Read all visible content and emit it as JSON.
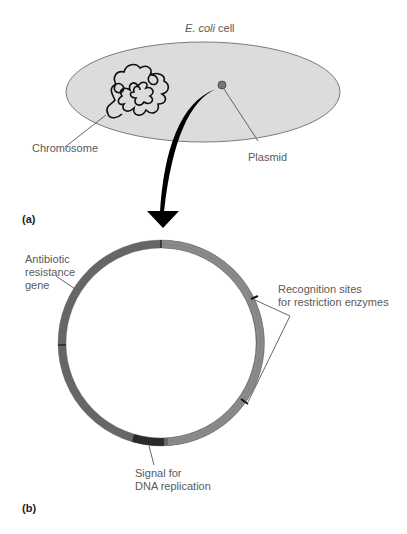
{
  "figure": {
    "panel_a": {
      "label": "(a)",
      "cell_title_italic": "E. coli",
      "cell_title_rest": " cell",
      "chromosome_label": "Chromosome",
      "plasmid_label": "Plasmid"
    },
    "panel_b": {
      "label": "(b)",
      "antibiotic_label": [
        "Antibiotic",
        "resistance",
        "gene"
      ],
      "recognition_label": [
        "Recognition sites",
        "for restriction enzymes"
      ],
      "signal_label": [
        "Signal for",
        "DNA replication"
      ]
    },
    "colors": {
      "cell_fill": "#dcdcdc",
      "cell_stroke": "#7a7a7a",
      "ring_dark": "#666666",
      "ring_light": "#8a8a8a",
      "origin_segment": "#2a2a2a",
      "arrow": "#000000"
    }
  }
}
